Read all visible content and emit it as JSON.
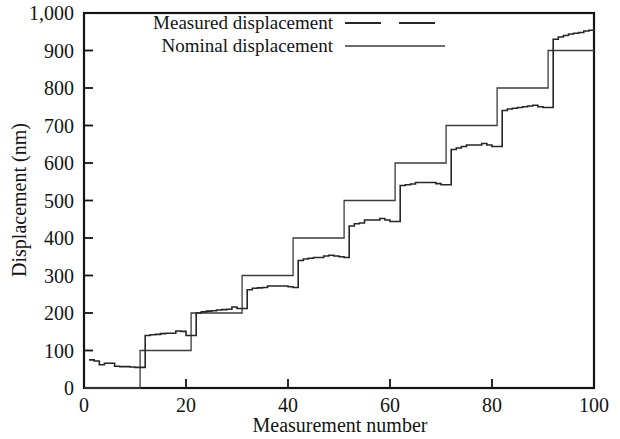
{
  "chart_data": {
    "type": "line",
    "title": "",
    "xlabel": "Measurement number",
    "ylabel": "Displacement (nm)",
    "xlim": [
      0,
      100
    ],
    "ylim": [
      0,
      1000
    ],
    "xticks": [
      "0",
      "20",
      "40",
      "60",
      "80",
      "100"
    ],
    "xtick_values": [
      0,
      20,
      40,
      60,
      80,
      100
    ],
    "yticks": [
      "0",
      "100",
      "200",
      "300",
      "400",
      "500",
      "600",
      "700",
      "800",
      "900",
      "1,000"
    ],
    "ytick_values": [
      0,
      100,
      200,
      300,
      400,
      500,
      600,
      700,
      800,
      900,
      1000
    ],
    "grid": false,
    "legend_position": "top-center",
    "series": [
      {
        "name": "Measured displacement",
        "style": "dashed",
        "color": "#262626",
        "x": [
          1,
          2,
          3,
          4,
          5,
          6,
          7,
          8,
          9,
          10,
          11,
          12,
          13,
          14,
          15,
          16,
          17,
          18,
          19,
          20,
          21,
          22,
          23,
          24,
          25,
          26,
          27,
          28,
          29,
          30,
          31,
          32,
          33,
          34,
          35,
          36,
          37,
          38,
          39,
          40,
          41,
          42,
          43,
          44,
          45,
          46,
          47,
          48,
          49,
          50,
          51,
          52,
          53,
          54,
          55,
          56,
          57,
          58,
          59,
          60,
          61,
          62,
          63,
          64,
          65,
          66,
          67,
          68,
          69,
          70,
          71,
          72,
          73,
          74,
          75,
          76,
          77,
          78,
          79,
          80,
          81,
          82,
          83,
          84,
          85,
          86,
          87,
          88,
          89,
          90,
          91,
          92,
          93,
          94,
          95,
          96,
          97,
          98,
          99,
          100
        ],
        "values": [
          75,
          72,
          62,
          66,
          66,
          58,
          57,
          57,
          56,
          55,
          55,
          140,
          142,
          143,
          145,
          146,
          146,
          152,
          151,
          140,
          140,
          200,
          203,
          205,
          206,
          208,
          209,
          210,
          216,
          212,
          212,
          262,
          266,
          267,
          268,
          272,
          272,
          272,
          272,
          270,
          268,
          340,
          344,
          346,
          348,
          348,
          352,
          354,
          352,
          350,
          348,
          432,
          438,
          440,
          448,
          448,
          448,
          452,
          448,
          444,
          444,
          540,
          542,
          544,
          548,
          548,
          548,
          548,
          545,
          542,
          542,
          636,
          640,
          644,
          648,
          648,
          648,
          652,
          648,
          644,
          644,
          740,
          744,
          746,
          748,
          750,
          752,
          754,
          750,
          748,
          748,
          930,
          936,
          940,
          944,
          946,
          948,
          952,
          954,
          956
        ]
      },
      {
        "name": "Nominal displacement",
        "style": "solid",
        "color": "#3c3c3c",
        "x": [
          0,
          11,
          21,
          31,
          41,
          51,
          61,
          71,
          81,
          91,
          100
        ],
        "step_values": [
          0,
          100,
          200,
          300,
          400,
          500,
          600,
          700,
          800,
          900,
          900
        ],
        "description": "staircase rising 100 nm every 10 measurements"
      }
    ]
  },
  "legend": {
    "entries": [
      {
        "label": "Measured displacement",
        "style": "dashed"
      },
      {
        "label": "Nominal displacement",
        "style": "solid"
      }
    ]
  },
  "axes": {
    "x_title": "Measurement number",
    "y_title": "Displacement (nm)"
  },
  "colors": {
    "measured": "#262626",
    "nominal": "#3c3c3c",
    "frame": "#141414",
    "background": "#ffffff"
  }
}
